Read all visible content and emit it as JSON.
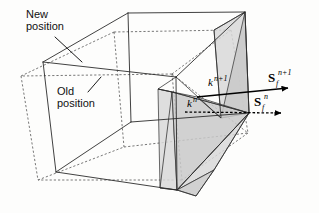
{
  "figure": {
    "caption_absent": true,
    "background_color": "#fdfdfc",
    "width": 319,
    "height": 213
  },
  "callouts": [
    {
      "id": "new-position",
      "line1": "New",
      "line2": "position",
      "x": 26,
      "y": 14,
      "leader_from_x": 55,
      "leader_from_y": 36,
      "leader_to_x": 82,
      "leader_to_y": 62
    },
    {
      "id": "old-position",
      "line1": "Old",
      "line2": "position",
      "x": 57,
      "y": 91,
      "leader_from_x": 88,
      "leader_from_y": 92,
      "leader_to_x": 101,
      "leader_to_y": 78
    }
  ],
  "labels": {
    "k_new": {
      "base": "k",
      "superscript": "n+1",
      "x": 210,
      "y": 85
    },
    "k_old": {
      "base": "k",
      "superscript": "n",
      "x": 189,
      "y": 106
    },
    "s_new": {
      "base": "S",
      "subscript": "f",
      "superscript": "n+1",
      "x": 272,
      "y": 80
    },
    "s_old": {
      "base": "S",
      "subscript": "f",
      "superscript": "n",
      "x": 257,
      "y": 104
    }
  },
  "vectors": [
    {
      "id": "s-f-n-plus-1",
      "style": "solid",
      "label": "S_f^{n+1}",
      "x1": 197,
      "y1": 97,
      "x2": 297,
      "y2": 88
    },
    {
      "id": "s-f-n",
      "style": "dashed",
      "label": "S_f^n",
      "x1": 185,
      "y1": 112,
      "x2": 290,
      "y2": 113
    }
  ],
  "colors": {
    "line_new": "#2b2b2b",
    "line_old": "#555555",
    "swept_face_fill": "#c9c9c9",
    "swept_face_fill_light": "#d8d8d8",
    "text": "#111111"
  },
  "geometry": {
    "new_cell_label": "New position",
    "old_cell_label": "Old position",
    "note": "Solid hexahedron = new position; dashed hexahedron = old position; grey triangles = swept face"
  }
}
